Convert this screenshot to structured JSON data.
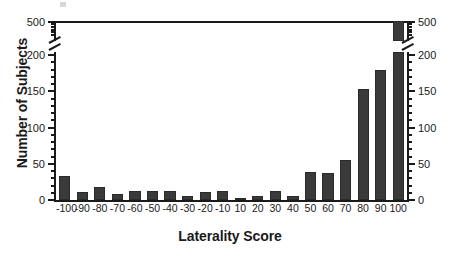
{
  "chart_data": {
    "type": "bar",
    "title": "",
    "xlabel": "Laterality Score",
    "ylabel": "Number of Subjects",
    "categories": [
      "-100",
      "-90",
      "-80",
      "-70",
      "-60",
      "-50",
      "-40",
      "-30",
      "-20",
      "-10",
      "10",
      "20",
      "30",
      "40",
      "50",
      "60",
      "70",
      "80",
      "90",
      "100"
    ],
    "values": [
      33,
      11,
      18,
      8,
      13,
      13,
      13,
      6,
      11,
      12,
      2,
      6,
      12,
      6,
      38,
      37,
      55,
      153,
      180,
      497
    ],
    "ylim": [
      0,
      500
    ],
    "y_axis_break": {
      "from": 200,
      "to": 500
    },
    "y_ticks_major_left": [
      "0",
      "50",
      "100",
      "150",
      "200",
      "500"
    ],
    "y_ticks_major_right": [
      "0",
      "50",
      "100",
      "150",
      "200",
      "500"
    ],
    "y_minor_tick_step": 10,
    "grid": false,
    "legend": null,
    "bar_color": "#3a3a3a",
    "axis_color": "#1a1a1a",
    "background": "#ffffff",
    "broken_bars": [
      "100"
    ]
  },
  "axis": {
    "ylabel": "Number of Subjects",
    "xlabel": "Laterality Score"
  }
}
